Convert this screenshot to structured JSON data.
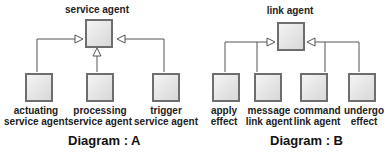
{
  "diagram_a": {
    "caption": "Diagram : A",
    "parent": "service agent",
    "children": [
      {
        "line1": "actuating",
        "line2": "service agent"
      },
      {
        "line1": "processing",
        "line2": "service agent"
      },
      {
        "line1": "trigger",
        "line2": "service agent"
      }
    ]
  },
  "diagram_b": {
    "caption": "Diagram : B",
    "parent": "link agent",
    "children": [
      {
        "line1": "apply",
        "line2": "effect"
      },
      {
        "line1": "message",
        "line2": "link agent"
      },
      {
        "line1": "command",
        "line2": "link agent"
      },
      {
        "line1": "undergo",
        "line2": "effect"
      }
    ]
  }
}
